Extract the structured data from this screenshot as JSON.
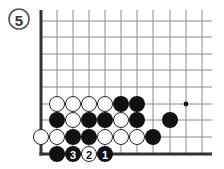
{
  "diagram": {
    "label": "5",
    "label_circle": {
      "cx": 19,
      "cy": 19,
      "r": 10
    },
    "colors": {
      "grid": "#8a8a8a",
      "edge": "#333333",
      "black": "#111111",
      "white_fill": "#ffffff",
      "white_stroke": "#222222",
      "background": "#ffffff"
    },
    "grid": {
      "cols_x": [
        41,
        57,
        73,
        89,
        105,
        121,
        137,
        153,
        170,
        186,
        202
      ],
      "rows_y": [
        21,
        37,
        54,
        70,
        87,
        104,
        120,
        137,
        154
      ],
      "top_y": 10,
      "right_x": 212,
      "left_edge_x": 41,
      "bottom_edge_y": 154
    },
    "star_points": [
      {
        "col": 9,
        "row": 5
      }
    ],
    "stones": [
      {
        "color": "white",
        "col": 1,
        "row": 5
      },
      {
        "color": "white",
        "col": 2,
        "row": 5
      },
      {
        "color": "white",
        "col": 3,
        "row": 5
      },
      {
        "color": "white",
        "col": 4,
        "row": 5
      },
      {
        "color": "black",
        "col": 5,
        "row": 5
      },
      {
        "color": "black",
        "col": 6,
        "row": 5
      },
      {
        "color": "black",
        "col": 1,
        "row": 6
      },
      {
        "color": "white",
        "col": 2,
        "row": 6
      },
      {
        "color": "black",
        "col": 3,
        "row": 6
      },
      {
        "color": "black",
        "col": 4,
        "row": 6
      },
      {
        "color": "white",
        "col": 5,
        "row": 6
      },
      {
        "color": "black",
        "col": 6,
        "row": 6
      },
      {
        "color": "black",
        "col": 8,
        "row": 6
      },
      {
        "color": "white",
        "col": 0,
        "row": 7
      },
      {
        "color": "white",
        "col": 1,
        "row": 7
      },
      {
        "color": "black",
        "col": 2,
        "row": 7
      },
      {
        "color": "black",
        "col": 3,
        "row": 7
      },
      {
        "color": "white",
        "col": 4,
        "row": 7
      },
      {
        "color": "white",
        "col": 5,
        "row": 7
      },
      {
        "color": "white",
        "col": 6,
        "row": 7
      },
      {
        "color": "black",
        "col": 7,
        "row": 7
      },
      {
        "color": "black",
        "col": 1,
        "row": 8
      },
      {
        "color": "black",
        "col": 2,
        "row": 8,
        "number": "3"
      },
      {
        "color": "white",
        "col": 3,
        "row": 8,
        "number": "2"
      },
      {
        "color": "black",
        "col": 4,
        "row": 8,
        "number": "1"
      }
    ],
    "stone_radius": 8
  }
}
